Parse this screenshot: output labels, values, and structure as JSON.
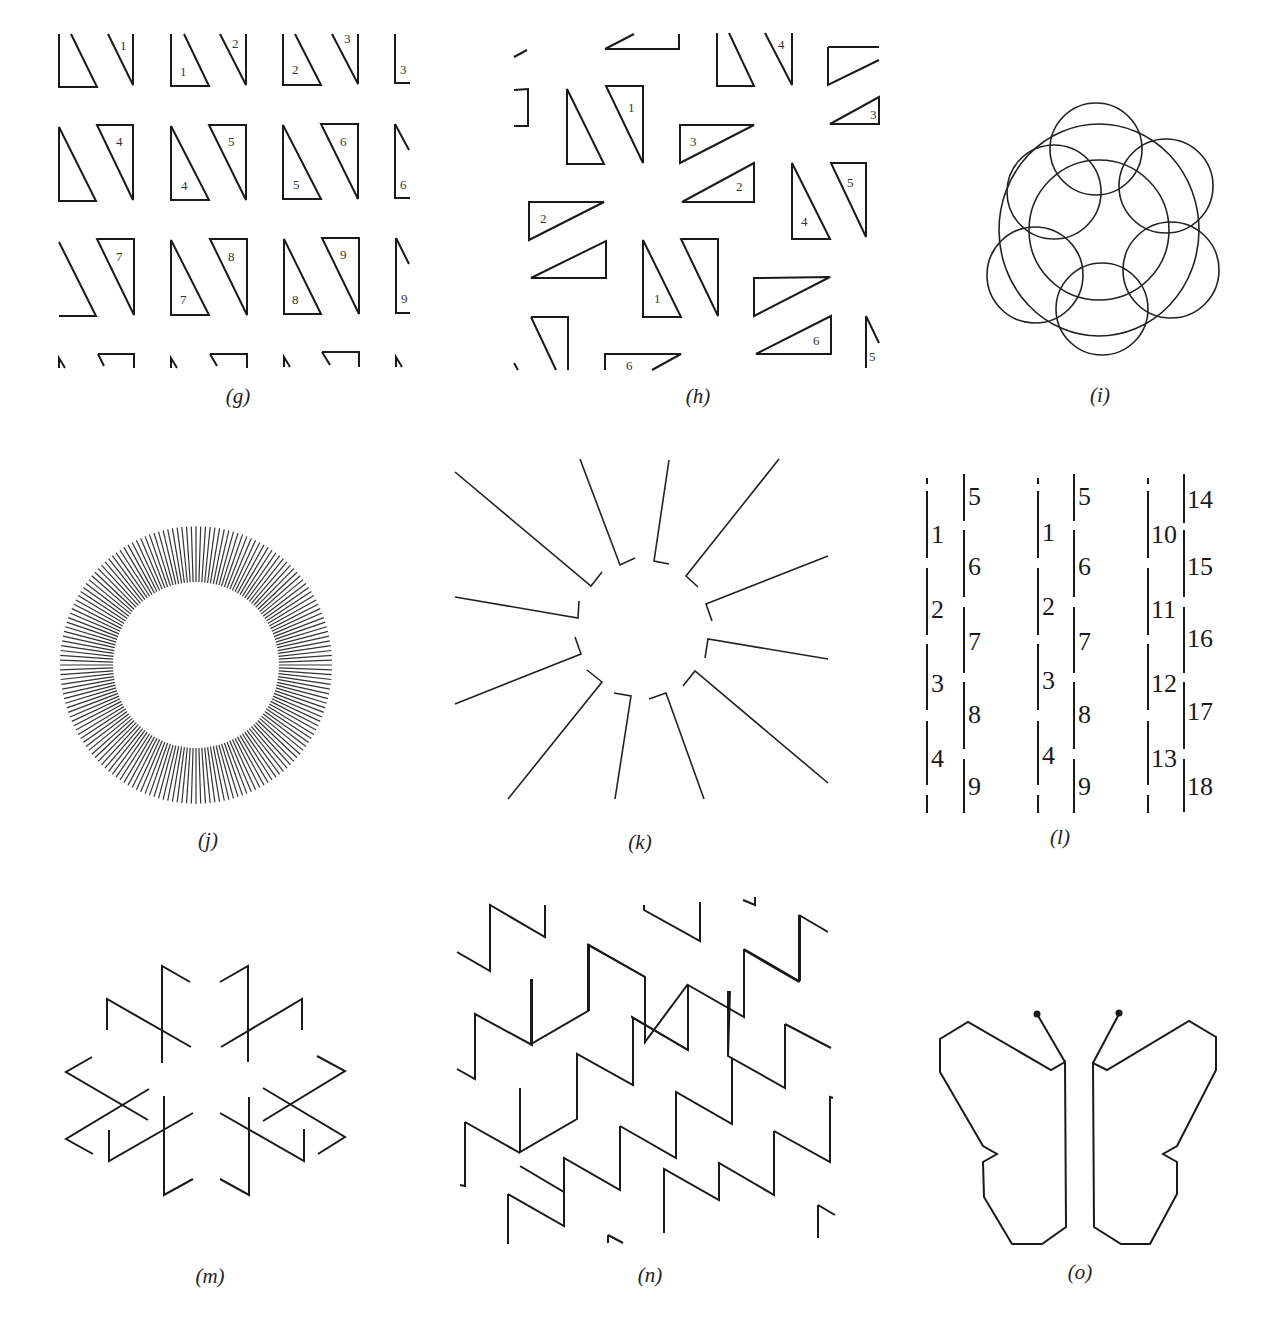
{
  "figure": {
    "panels": [
      {
        "id": "g",
        "caption": "(g)",
        "description": "Grid of right-triangle pairs labeled 1-9"
      },
      {
        "id": "h",
        "caption": "(h)",
        "description": "Rotated right triangles labeled 1-6"
      },
      {
        "id": "i",
        "caption": "(i)",
        "description": "Ring of six overlapping circles around a central circle"
      },
      {
        "id": "j",
        "caption": "(j)",
        "description": "Annulus of radial line segments"
      },
      {
        "id": "k",
        "caption": "(k)",
        "description": "Twelve radial hooked line segments"
      },
      {
        "id": "l",
        "caption": "(l)",
        "description": "Vertical segments numbered 1-18"
      },
      {
        "id": "m",
        "caption": "(m)",
        "description": "Six-fold star of crossed zigzag arms"
      },
      {
        "id": "n",
        "caption": "(n)",
        "description": "Rows of repeating sawtooth waves"
      },
      {
        "id": "o",
        "caption": "(o)",
        "description": "Butterfly outline with antennae"
      }
    ],
    "g_labels": {
      "row1": [
        "1",
        "2",
        "3",
        "1",
        "2",
        "3"
      ],
      "row2": [
        "4",
        "5",
        "6",
        "4",
        "5",
        "6"
      ],
      "row3": [
        "7",
        "8",
        "9",
        "7",
        "8",
        "9"
      ]
    },
    "h_labels": [
      "1",
      "1",
      "2",
      "2",
      "3",
      "3",
      "4",
      "4",
      "5",
      "5",
      "6",
      "6"
    ],
    "l_columns": [
      {
        "left": [
          "1",
          "2",
          "3",
          "4"
        ],
        "right": [
          "5",
          "6",
          "7",
          "8",
          "9"
        ]
      },
      {
        "left": [
          "1",
          "2",
          "3",
          "4"
        ],
        "right": [
          "5",
          "6",
          "7",
          "8",
          "9"
        ]
      },
      {
        "left": [
          "10",
          "11",
          "12",
          "13"
        ],
        "right": [
          "14",
          "15",
          "16",
          "17",
          "18"
        ]
      }
    ]
  }
}
